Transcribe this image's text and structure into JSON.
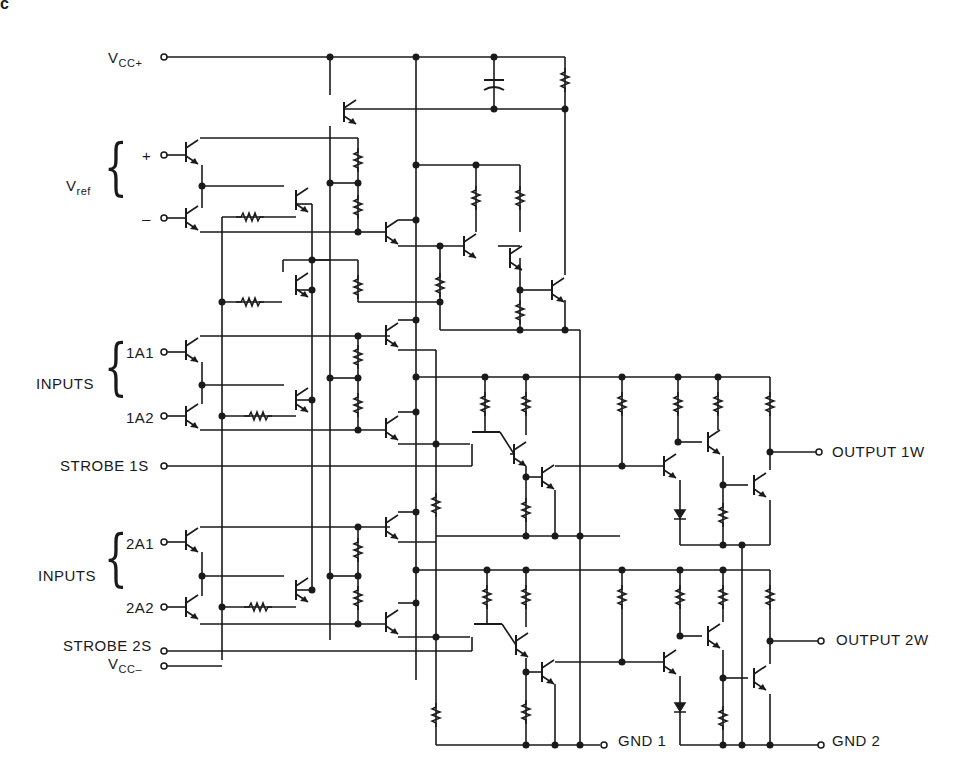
{
  "figure": {
    "corner_label": "c",
    "type": "schematic",
    "colors": {
      "ink": "#1a1a1a",
      "background": "#ffffff"
    }
  },
  "terminals": {
    "vcc_plus": {
      "main": "V",
      "sub": "CC+"
    },
    "vref": {
      "main": "V",
      "sub": "ref"
    },
    "vref_plus": "+",
    "vref_minus": "–",
    "inputs1_group": "INPUTS",
    "in_1a1": "1A1",
    "in_1a2": "1A2",
    "strobe_1s": "STROBE 1S",
    "inputs2_group": "INPUTS",
    "in_2a1": "2A1",
    "in_2a2": "2A2",
    "strobe_2s": "STROBE 2S",
    "vcc_minus": {
      "main": "V",
      "sub": "CC–"
    },
    "output_1w": "OUTPUT 1W",
    "output_2w": "OUTPUT 2W",
    "gnd_1": "GND 1",
    "gnd_2": "GND 2"
  }
}
